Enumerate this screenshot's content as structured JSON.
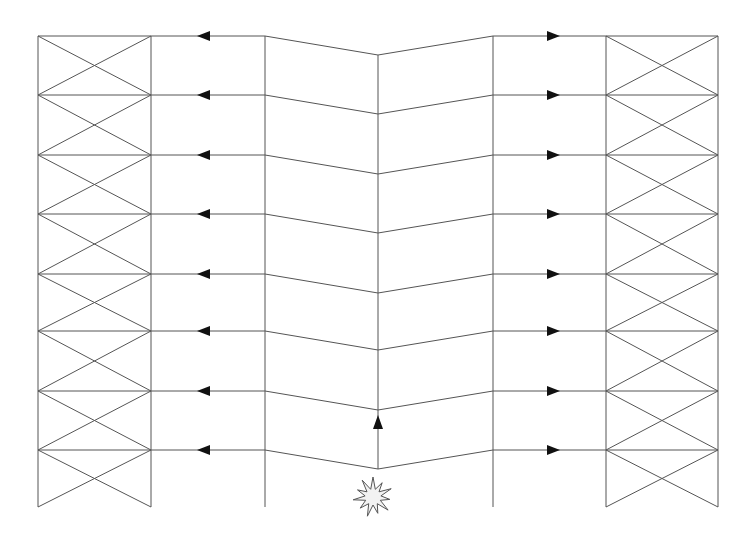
{
  "diagram": {
    "title": "",
    "colors": {
      "line": "#555555",
      "arrow": "#111111",
      "blast_fill": "#f2f2f2",
      "background": "#ffffff"
    },
    "columns_x": [
      38,
      151,
      265,
      378,
      493,
      606,
      718
    ],
    "floor_levels_y": [
      36,
      95,
      155,
      214,
      274,
      331,
      391,
      450
    ],
    "center_drop": 19,
    "base_y": 507,
    "left_arrow_x": 205,
    "right_arrow_x": 552,
    "up_arrow": {
      "x": 378,
      "y": 425
    },
    "blast": {
      "cx": 373,
      "cy": 497,
      "label": "explosion-icon"
    },
    "braced_bays": [
      "left",
      "right"
    ]
  }
}
